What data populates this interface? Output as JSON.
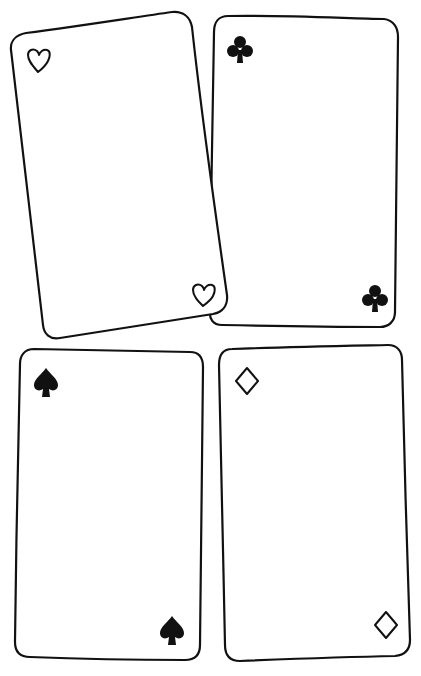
{
  "scene": {
    "description": "Hand-drawn blank playing cards",
    "background": "#ffffff",
    "ink": "#111111"
  },
  "cards": [
    {
      "suit": "heart",
      "fill": "outline",
      "position": "top-left",
      "tilted": true
    },
    {
      "suit": "club",
      "fill": "solid",
      "position": "top-right",
      "tilted": false
    },
    {
      "suit": "spade",
      "fill": "solid",
      "position": "bottom-left",
      "tilted": false
    },
    {
      "suit": "diamond",
      "fill": "outline",
      "position": "bottom-right",
      "tilted": false
    }
  ]
}
